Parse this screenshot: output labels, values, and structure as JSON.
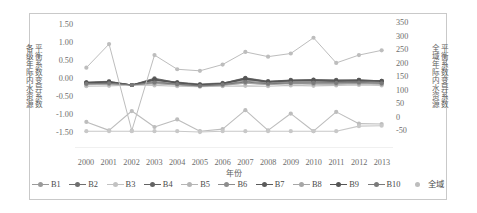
{
  "axes": {
    "left_title_line1": "各级年际内水资源",
    "left_title_line2": "平衡系数变异系数",
    "right_title_line1": "全域年际内水资源",
    "right_title_line2": "平衡系数变异系数",
    "x_title": "年份",
    "left_ticks": [
      "1.50",
      "1.00",
      "0.50",
      "0.00",
      "-0.50",
      "-1.00",
      "-1.50"
    ],
    "right_ticks": [
      "350",
      "300",
      "250",
      "200",
      "150",
      "100",
      "50",
      "0",
      "-50"
    ],
    "x_ticks": [
      "2000",
      "2001",
      "2002",
      "2003",
      "2004",
      "2005",
      "2006",
      "2007",
      "2008",
      "2009",
      "2010",
      "2011",
      "2012",
      "2013"
    ]
  },
  "legend": [
    {
      "label": "B1",
      "color": "#9a9a9a",
      "style": "line"
    },
    {
      "label": "B2",
      "color": "#6f6f6f",
      "style": "line"
    },
    {
      "label": "B3",
      "color": "#c2c2c2",
      "style": "line"
    },
    {
      "label": "B4",
      "color": "#636363",
      "style": "line"
    },
    {
      "label": "B5",
      "color": "#b5b5b5",
      "style": "line"
    },
    {
      "label": "B6",
      "color": "#8d8d8d",
      "style": "line"
    },
    {
      "label": "B7",
      "color": "#5a5a5a",
      "style": "line"
    },
    {
      "label": "B8",
      "color": "#a6a6a6",
      "style": "line"
    },
    {
      "label": "B9",
      "color": "#555555",
      "style": "line"
    },
    {
      "label": "B10",
      "color": "#7a7a7a",
      "style": "line"
    },
    {
      "label": "全域",
      "color": "#bdbdbd",
      "style": "dot"
    }
  ],
  "chart_data": {
    "type": "line",
    "title": "",
    "xlabel": "年份",
    "ylabel": "各级年际内水资源平衡系数变异系数",
    "y2label": "全域年际内水资源平衡系数变异系数",
    "x": [
      "2000",
      "2001",
      "2002",
      "2003",
      "2004",
      "2005",
      "2006",
      "2007",
      "2008",
      "2009",
      "2010",
      "2011",
      "2012",
      "2013"
    ],
    "ylim": [
      -1.5,
      1.5
    ],
    "y2lim": [
      -50,
      350
    ],
    "grid": false,
    "legend_position": "bottom",
    "series": [
      {
        "name": "B1",
        "axis": "left",
        "color": "#9a9a9a",
        "values": [
          0.07,
          0.09,
          0.0,
          0.1,
          0.07,
          0.02,
          0.05,
          0.11,
          0.08,
          0.09,
          0.1,
          0.08,
          0.09,
          0.07
        ]
      },
      {
        "name": "B2",
        "axis": "left",
        "color": "#6f6f6f",
        "values": [
          0.05,
          0.06,
          0.0,
          0.16,
          0.06,
          0.01,
          0.04,
          0.17,
          0.09,
          0.12,
          0.13,
          0.12,
          0.12,
          0.1
        ]
      },
      {
        "name": "B3",
        "axis": "left",
        "color": "#c2c2c2",
        "values": [
          -0.03,
          -0.02,
          0.0,
          -0.01,
          -0.03,
          -0.04,
          -0.03,
          -0.02,
          -0.03,
          -0.01,
          -0.02,
          -0.01,
          0.0,
          -0.01
        ]
      },
      {
        "name": "B4",
        "axis": "left",
        "color": "#636363",
        "values": [
          0.06,
          0.07,
          0.0,
          0.13,
          0.05,
          0.0,
          0.03,
          0.15,
          0.07,
          0.1,
          0.11,
          0.1,
          0.11,
          0.09
        ]
      },
      {
        "name": "B5",
        "axis": "left",
        "color": "#b5b5b5",
        "values": [
          0.02,
          0.03,
          0.0,
          0.04,
          0.01,
          -0.02,
          0.0,
          0.05,
          0.02,
          0.04,
          0.03,
          0.03,
          0.04,
          0.03
        ]
      },
      {
        "name": "B6",
        "axis": "left",
        "color": "#8d8d8d",
        "values": [
          0.04,
          0.05,
          0.0,
          0.08,
          0.03,
          -0.01,
          0.02,
          0.09,
          0.05,
          0.07,
          0.07,
          0.06,
          0.07,
          0.06
        ]
      },
      {
        "name": "B7",
        "axis": "left",
        "color": "#5a5a5a",
        "values": [
          0.06,
          0.08,
          0.0,
          0.14,
          0.06,
          0.01,
          0.04,
          0.16,
          0.08,
          0.11,
          0.12,
          0.11,
          0.12,
          0.1
        ]
      },
      {
        "name": "B8",
        "axis": "left",
        "color": "#a6a6a6",
        "values": [
          0.01,
          0.02,
          0.0,
          0.03,
          0.0,
          -0.03,
          -0.01,
          0.04,
          0.01,
          0.03,
          0.02,
          0.02,
          0.03,
          0.02
        ]
      },
      {
        "name": "B9",
        "axis": "left",
        "color": "#555555",
        "values": [
          0.05,
          0.07,
          0.0,
          0.12,
          0.05,
          0.0,
          0.03,
          0.14,
          0.07,
          0.1,
          0.1,
          0.09,
          0.1,
          0.09
        ]
      },
      {
        "name": "B10",
        "axis": "left",
        "color": "#7a7a7a",
        "values": [
          0.03,
          0.04,
          0.0,
          0.06,
          0.02,
          -0.02,
          0.01,
          0.07,
          0.03,
          0.05,
          0.05,
          0.05,
          0.06,
          0.04
        ]
      },
      {
        "name": "全域",
        "axis": "right",
        "color": "#bdbdbd",
        "values": [
          205,
          280,
          5,
          245,
          200,
          195,
          215,
          255,
          240,
          250,
          300,
          220,
          245,
          260
        ]
      },
      {
        "name": "全域-low",
        "axis": "left",
        "color": "#bdbdbd",
        "hidden_label": true,
        "values": [
          -0.88,
          -1.08,
          -0.62,
          -1.0,
          -0.82,
          -1.1,
          -1.05,
          -0.6,
          -1.08,
          -0.68,
          -1.1,
          -0.64,
          -0.92,
          -0.93
        ]
      },
      {
        "name": "全域-flat",
        "axis": "left",
        "color": "#c8c8c8",
        "hidden_label": true,
        "values": [
          -1.1,
          -1.1,
          -1.1,
          -1.1,
          -1.1,
          -1.12,
          -1.1,
          -1.1,
          -1.1,
          -1.1,
          -1.1,
          -1.1,
          -0.98,
          -0.97
        ]
      }
    ]
  }
}
